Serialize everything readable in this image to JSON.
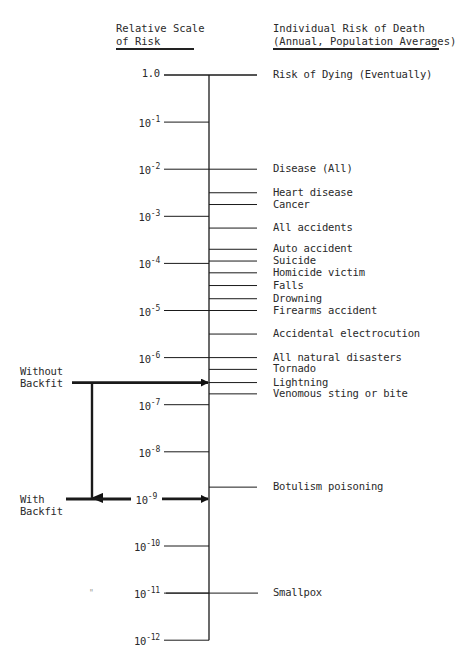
{
  "header": {
    "left_line1": "Relative Scale",
    "left_line2": "of Risk",
    "right_line1": "Individual Risk of Death",
    "right_line2": "(Annual, Population Averages)"
  },
  "scale": [
    {
      "label": "1.0",
      "base": "",
      "exp": "",
      "log10": 0
    },
    {
      "label": "10-1",
      "base": "10",
      "exp": "-1",
      "log10": -1
    },
    {
      "label": "10-2",
      "base": "10",
      "exp": "-2",
      "log10": -2
    },
    {
      "label": "10-3",
      "base": "10",
      "exp": "-3",
      "log10": -3
    },
    {
      "label": "10-4",
      "base": "10",
      "exp": "-4",
      "log10": -4
    },
    {
      "label": "10-5",
      "base": "10",
      "exp": "-5",
      "log10": -5
    },
    {
      "label": "10-6",
      "base": "10",
      "exp": "-6",
      "log10": -6
    },
    {
      "label": "10-7",
      "base": "10",
      "exp": "-7",
      "log10": -7
    },
    {
      "label": "10-8",
      "base": "10",
      "exp": "-8",
      "log10": -8
    },
    {
      "label": "10-9",
      "base": "10",
      "exp": "-9",
      "log10": -9
    },
    {
      "label": "10-10",
      "base": "10",
      "exp": "-10",
      "log10": -10
    },
    {
      "label": "10-11",
      "base": "10",
      "exp": "-11",
      "log10": -11
    },
    {
      "label": "10-12",
      "base": "10",
      "exp": "-12",
      "log10": -12
    }
  ],
  "risks": [
    {
      "label": "Risk of Dying (Eventually)",
      "log10": 0.0
    },
    {
      "label": "Disease (All)",
      "log10": -2.0
    },
    {
      "label": "Heart disease",
      "log10": -2.5
    },
    {
      "label": "Cancer",
      "log10": -2.75
    },
    {
      "label": "All accidents",
      "log10": -3.25
    },
    {
      "label": "Auto accident",
      "log10": -3.7
    },
    {
      "label": "Suicide",
      "log10": -3.95
    },
    {
      "label": "Homicide victim",
      "log10": -4.2
    },
    {
      "label": "Falls",
      "log10": -4.47
    },
    {
      "label": "Drowning",
      "log10": -4.75
    },
    {
      "label": "Firearms accident",
      "log10": -5.0
    },
    {
      "label": "Accidental electrocution",
      "log10": -5.5
    },
    {
      "label": "All natural disasters",
      "log10": -6.0
    },
    {
      "label": "Tornado",
      "log10": -6.25
    },
    {
      "label": "Lightning",
      "log10": -6.53
    },
    {
      "label": "Venomous sting or bite",
      "log10": -6.77
    },
    {
      "label": "Botulism poisoning",
      "log10": -8.75
    },
    {
      "label": "Smallpox",
      "log10": -11.0
    }
  ],
  "backfit": {
    "without_line1": "Without",
    "without_line2": "Backfit",
    "without_log10": -6.53,
    "with_line1": "With",
    "with_line2": "Backfit",
    "with_log10": -9.0
  },
  "stray_mark": "\""
}
